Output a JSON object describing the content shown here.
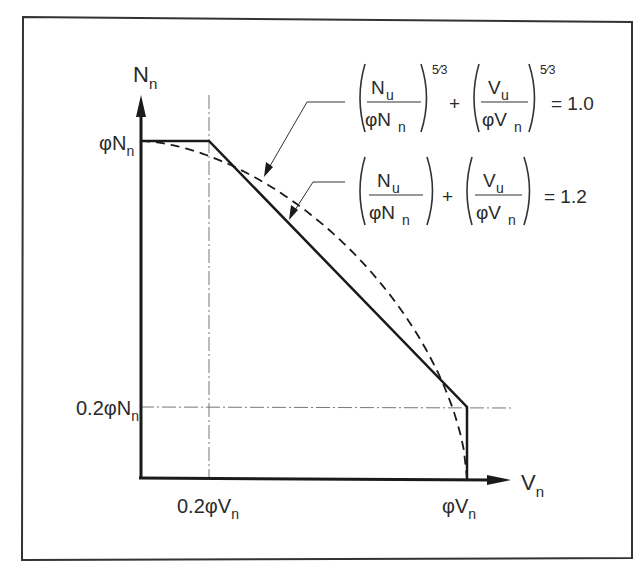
{
  "figure": {
    "y_axis_label": "N",
    "y_axis_sub": "n",
    "x_axis_label": "V",
    "x_axis_sub": "n",
    "ticks": {
      "y_top": {
        "prefix": "φN",
        "sub": "n"
      },
      "y_low": {
        "prefix": "0.2φN",
        "sub": "n"
      },
      "x_low": {
        "prefix": "0.2φV",
        "sub": "n"
      },
      "x_top": {
        "prefix": "φV",
        "sub": "n"
      }
    },
    "equations": [
      {
        "num1": "N",
        "num1_sub": "u",
        "den1": "φN",
        "den1_sub": "n",
        "exp": "5⁄3",
        "num2": "V",
        "num2_sub": "u",
        "den2": "φV",
        "den2_sub": "n",
        "rhs": "= 1.0"
      },
      {
        "num1": "N",
        "num1_sub": "u",
        "den1": "φN",
        "den1_sub": "n",
        "exp": "",
        "num2": "V",
        "num2_sub": "u",
        "den2": "φV",
        "den2_sub": "n",
        "rhs": "= 1.2"
      }
    ],
    "plus": "+"
  },
  "chart_data": {
    "type": "line",
    "title": "",
    "xlabel": "Vn",
    "ylabel": "Nn",
    "xlim": [
      0,
      1.0
    ],
    "ylim": [
      0,
      1.0
    ],
    "grid": false,
    "reference_lines": [
      {
        "axis": "x",
        "value": 0.2,
        "label": "0.2φVn",
        "style": "dash-dot"
      },
      {
        "axis": "y",
        "value": 0.2,
        "label": "0.2φNn",
        "style": "dash-dot"
      }
    ],
    "series": [
      {
        "name": "(Nu/φNn) + (Vu/φVn) = 1.2",
        "style": "solid",
        "x": [
          0,
          0.2,
          1.0,
          1.0
        ],
        "y": [
          1.0,
          1.0,
          0.2,
          0.0
        ]
      },
      {
        "name": "(Nu/φNn)^(5/3) + (Vu/φVn)^(5/3) = 1.0",
        "style": "dashed",
        "x": [
          0,
          0.2,
          0.4,
          0.6,
          0.8,
          0.9,
          0.95,
          1.0
        ],
        "y": [
          1.0,
          0.94,
          0.85,
          0.71,
          0.5,
          0.36,
          0.25,
          0.0
        ]
      }
    ]
  }
}
